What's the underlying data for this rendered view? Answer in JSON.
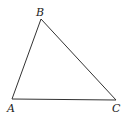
{
  "diagram": {
    "type": "triangle",
    "stroke_color": "#333333",
    "background": "#ffffff",
    "vertices": [
      {
        "name": "A",
        "x": 12,
        "y": 99,
        "label_x": 7,
        "label_y": 112
      },
      {
        "name": "B",
        "x": 41,
        "y": 19,
        "label_x": 36,
        "label_y": 16
      },
      {
        "name": "C",
        "x": 116,
        "y": 100,
        "label_x": 112,
        "label_y": 112
      }
    ],
    "edges": [
      [
        "A",
        "B"
      ],
      [
        "B",
        "C"
      ],
      [
        "C",
        "A"
      ]
    ]
  }
}
